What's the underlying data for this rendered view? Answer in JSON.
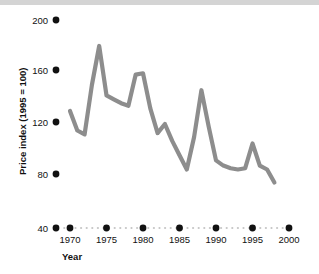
{
  "figure": {
    "background_color": "#ffffff",
    "top_band_color": "#d4d4d4",
    "line_color": "#8d8d8d",
    "tick_color": "#111111",
    "baseline_dot_color": "#b5b5b5"
  },
  "axes": {
    "y_title": "Price index (1995 = 100)",
    "x_title": "Year",
    "y_ticks": [
      "200",
      "160",
      "120",
      "80",
      "40"
    ],
    "x_ticks": [
      "1970",
      "1975",
      "1980",
      "1985",
      "1990",
      "1995",
      "2000"
    ]
  },
  "chart_data": {
    "type": "line",
    "title": "",
    "xlabel": "Year",
    "ylabel": "Price index (1995 = 100)",
    "xlim": [
      1968.2,
      2001.0
    ],
    "ylim": [
      40,
      210
    ],
    "yticks": [
      40,
      80,
      120,
      160,
      200
    ],
    "xticks": [
      1970,
      1975,
      1980,
      1985,
      1990,
      1995,
      2000
    ],
    "grid": false,
    "legend": "none",
    "series": [
      {
        "name": "Price index",
        "x": [
          1970,
          1971,
          1972,
          1973,
          1974,
          1975,
          1976,
          1977,
          1978,
          1979,
          1980,
          1981,
          1982,
          1983,
          1984,
          1985,
          1986,
          1987,
          1988,
          1989,
          1990,
          1991,
          1992,
          1993,
          1994,
          1995,
          1996,
          1997,
          1998
        ],
        "values": [
          130,
          115,
          112,
          150,
          180,
          142,
          139,
          136,
          134,
          158,
          159,
          132,
          113,
          120,
          107,
          96,
          85,
          110,
          146,
          118,
          92,
          88,
          86,
          85,
          86,
          105,
          88,
          85,
          75
        ]
      }
    ]
  }
}
